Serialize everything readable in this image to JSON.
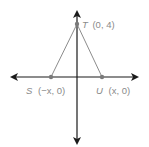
{
  "diagram": {
    "type": "coordinate-plane-triangle",
    "colors": {
      "axis": "#1a1a1a",
      "side": "#8c8c8c",
      "point": "#7a7a7a",
      "label": "#8a8a8a"
    },
    "points": [
      {
        "id": "T",
        "name": "T",
        "coords": "(0, 4)",
        "px": [
          77,
          24
        ]
      },
      {
        "id": "S",
        "name": "S",
        "coords": "(−x, 0)",
        "px": [
          51,
          77
        ]
      },
      {
        "id": "U",
        "name": "U",
        "coords": "(x, 0)",
        "px": [
          102,
          77
        ]
      }
    ],
    "labels": {
      "T": {
        "name": "T",
        "coords": "(0, 4)"
      },
      "S": {
        "name": "S",
        "coords": "(−x, 0)"
      },
      "U": {
        "name": "U",
        "coords": "(x, 0)"
      }
    },
    "axes": {
      "x": {
        "from": [
          12,
          77
        ],
        "to": [
          137,
          77
        ]
      },
      "y": {
        "from": [
          77,
          12
        ],
        "to": [
          77,
          143
        ]
      }
    },
    "segments": [
      {
        "from": "S",
        "to": "T"
      },
      {
        "from": "T",
        "to": "U"
      }
    ]
  }
}
